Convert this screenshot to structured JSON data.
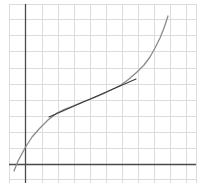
{
  "figure": {
    "colors": {
      "background": "#ffffff",
      "grid": "#dcdcdc",
      "axis": "#4a4a4a",
      "curve": "#8a8a8a",
      "tangent": "#3c3c3c"
    },
    "grid": {
      "vertical_x": [
        9,
        25,
        42,
        58,
        74,
        90,
        106,
        122,
        138,
        154,
        170,
        186,
        196
      ],
      "horizontal_y": [
        4,
        19,
        35,
        51,
        68,
        84,
        100,
        116,
        132,
        148,
        164,
        179
      ]
    },
    "axes": {
      "x_axis": {
        "x1": 9,
        "y": 164,
        "x2": 196
      },
      "y_axis": {
        "x": 25,
        "y1": 4,
        "y2": 183
      }
    },
    "curve": {
      "points": [
        [
          14,
          171
        ],
        [
          18,
          161
        ],
        [
          25,
          148
        ],
        [
          32,
          137
        ],
        [
          40,
          128
        ],
        [
          48,
          120
        ],
        [
          57,
          113
        ],
        [
          65,
          109
        ],
        [
          73,
          106
        ],
        [
          80,
          103
        ],
        [
          88,
          100
        ],
        [
          96,
          97
        ],
        [
          105,
          93
        ],
        [
          113,
          89
        ],
        [
          121,
          85
        ],
        [
          129,
          79
        ],
        [
          137,
          72
        ],
        [
          144,
          65
        ],
        [
          150,
          57
        ],
        [
          155,
          48
        ],
        [
          160,
          38
        ],
        [
          164,
          28
        ],
        [
          168,
          16
        ]
      ]
    },
    "tangent": {
      "x1": 49,
      "y1": 117,
      "x2": 136,
      "y2": 79,
      "point_of_tangency": [
        88,
        100
      ]
    }
  }
}
